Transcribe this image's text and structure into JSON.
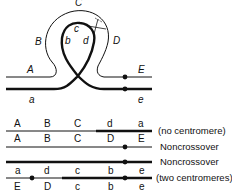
{
  "loop_diagram": {
    "outer_labels": [
      "A",
      "B",
      "C",
      "D",
      "E"
    ],
    "inner_labels": [
      "a",
      "b",
      "c",
      "d",
      "e"
    ]
  },
  "products": [
    {
      "top_labels": [
        "A",
        "B",
        "C",
        "d",
        "a"
      ],
      "caption": "(no centromere)"
    },
    {
      "top_labels": [
        "A",
        "B",
        "C",
        "D",
        "E"
      ],
      "caption": "Noncrossover"
    },
    {
      "bottom_labels": [
        "a",
        "d",
        "c",
        "b",
        "e"
      ],
      "caption": "Noncrossover"
    },
    {
      "bottom_labels": [
        "E",
        "D",
        "c",
        "b",
        "e"
      ],
      "caption": "(two centromeres)"
    }
  ],
  "colors": {
    "line": "#111111",
    "background": "#ffffff"
  }
}
